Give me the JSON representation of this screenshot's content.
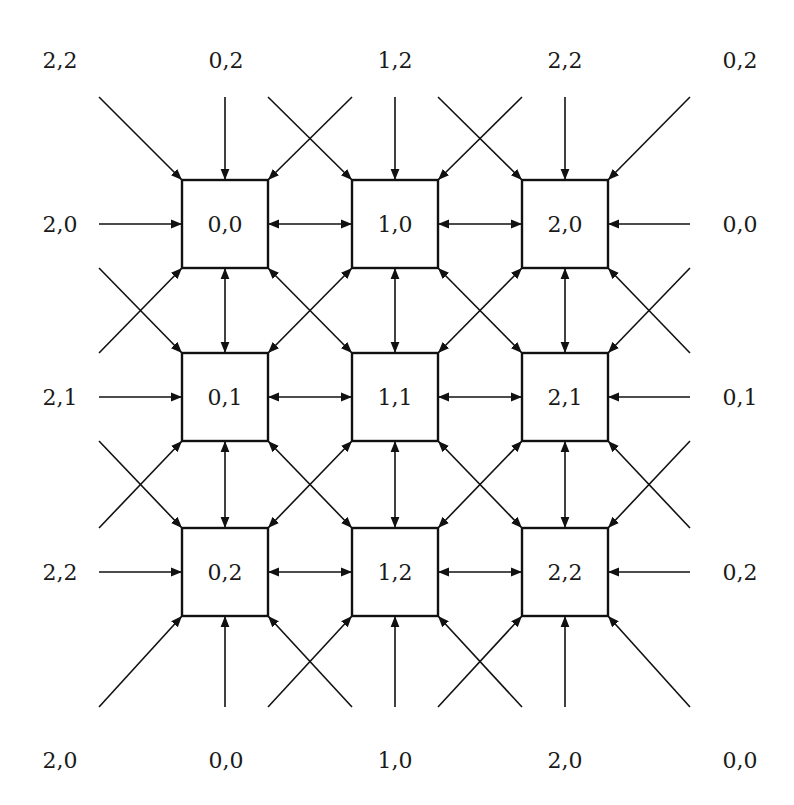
{
  "diagram": {
    "grid": {
      "columns": 3,
      "rows": 3,
      "col_centers_x": [
        225,
        395,
        565
      ],
      "row_centers_y": [
        224,
        397,
        572
      ],
      "box_half_width": 43,
      "box_half_height": 44
    },
    "nodes": [
      {
        "id": "0,0",
        "col": 0,
        "row": 0,
        "label": "0,0"
      },
      {
        "id": "1,0",
        "col": 1,
        "row": 0,
        "label": "1,0"
      },
      {
        "id": "2,0",
        "col": 2,
        "row": 0,
        "label": "2,0"
      },
      {
        "id": "0,1",
        "col": 0,
        "row": 1,
        "label": "0,1"
      },
      {
        "id": "1,1",
        "col": 1,
        "row": 1,
        "label": "1,1"
      },
      {
        "id": "2,1",
        "col": 2,
        "row": 1,
        "label": "2,1"
      },
      {
        "id": "0,2",
        "col": 0,
        "row": 2,
        "label": "0,2"
      },
      {
        "id": "1,2",
        "col": 1,
        "row": 2,
        "label": "1,2"
      },
      {
        "id": "2,2",
        "col": 2,
        "row": 2,
        "label": "2,2"
      }
    ],
    "boundary_labels": {
      "top": [
        {
          "x": 60,
          "label": "2,2"
        },
        {
          "x": 226,
          "label": "0,2"
        },
        {
          "x": 395,
          "label": "1,2"
        },
        {
          "x": 565,
          "label": "2,2"
        },
        {
          "x": 740,
          "label": "0,2"
        }
      ],
      "bottom": [
        {
          "x": 60,
          "label": "2,0"
        },
        {
          "x": 226,
          "label": "0,0"
        },
        {
          "x": 395,
          "label": "1,0"
        },
        {
          "x": 565,
          "label": "2,0"
        },
        {
          "x": 740,
          "label": "0,0"
        }
      ],
      "left": [
        {
          "y": 224,
          "label": "2,0"
        },
        {
          "y": 397,
          "label": "2,1"
        },
        {
          "y": 572,
          "label": "2,2"
        }
      ],
      "right": [
        {
          "y": 224,
          "label": "0,0"
        },
        {
          "y": 397,
          "label": "0,1"
        },
        {
          "y": 572,
          "label": "0,2"
        }
      ]
    },
    "label_positions": {
      "top_y": 60,
      "bottom_y": 760,
      "left_x": 60,
      "right_x": 740
    },
    "outer_line_ends": {
      "top_y": 97,
      "bottom_y": 707,
      "left_x": 99,
      "right_x": 690
    },
    "colors": {
      "stroke": "#111111",
      "background": "#ffffff",
      "text": "#1a1a1a"
    }
  }
}
